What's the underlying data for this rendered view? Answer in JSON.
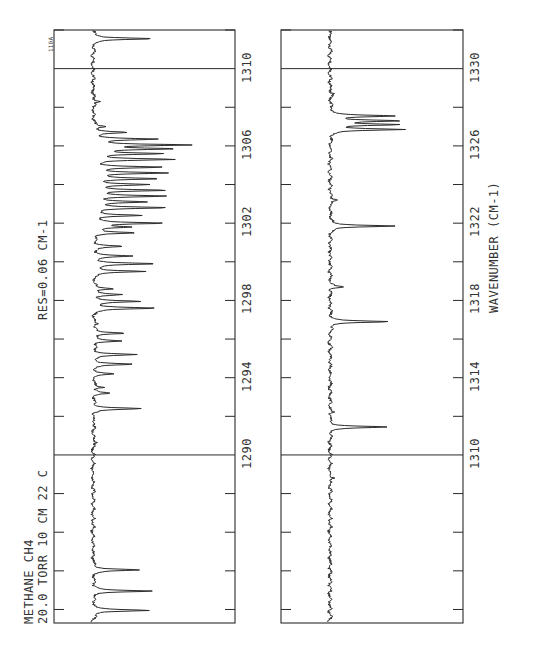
{
  "chart_data": {
    "type": "line",
    "title": "METHANE CH4",
    "subtitle_lines": [
      "METHANE  CH4",
      "20.0 TORR  10 CM  22 C"
    ],
    "annotation_resolution": "RES=0.06 CM-1",
    "plate_id": "110A",
    "xlabel": "WAVENUMBER (CM-1)",
    "ylabel": "",
    "orientation": "rotated -90deg (wavenumber increases upward, absorption extends right)",
    "grid": false,
    "panels": [
      {
        "name": "lower-range",
        "xlim": [
          1281.3,
          1312.0
        ],
        "ticks_labeled": [
          1290,
          1294,
          1298,
          1302,
          1306,
          1310
        ],
        "minor_ticks_every": 2,
        "boundary_lines": [
          1290,
          1310
        ],
        "series": [
          {
            "name": "transmittance",
            "peaks": [
              {
                "x": 1281.95,
                "depth": 0.78
              },
              {
                "x": 1282.95,
                "depth": 0.78
              },
              {
                "x": 1284.05,
                "depth": 0.62
              },
              {
                "x": 1290.65,
                "depth": 0.08
              },
              {
                "x": 1291.6,
                "depth": 0.05
              },
              {
                "x": 1292.4,
                "depth": 0.66
              },
              {
                "x": 1293.2,
                "depth": 0.22
              },
              {
                "x": 1293.5,
                "depth": 0.15
              },
              {
                "x": 1294.2,
                "depth": 0.27
              },
              {
                "x": 1294.7,
                "depth": 0.52
              },
              {
                "x": 1295.2,
                "depth": 0.57
              },
              {
                "x": 1295.9,
                "depth": 0.4
              },
              {
                "x": 1296.3,
                "depth": 0.45
              },
              {
                "x": 1296.8,
                "depth": 0.07
              },
              {
                "x": 1297.6,
                "depth": 0.86
              },
              {
                "x": 1297.95,
                "depth": 0.62
              },
              {
                "x": 1298.3,
                "depth": 0.36
              },
              {
                "x": 1298.6,
                "depth": 0.28
              },
              {
                "x": 1299.5,
                "depth": 0.7
              },
              {
                "x": 1299.9,
                "depth": 0.85
              },
              {
                "x": 1300.3,
                "depth": 0.5
              },
              {
                "x": 1300.8,
                "depth": 0.4
              },
              {
                "x": 1301.5,
                "depth": 0.55
              },
              {
                "x": 1301.8,
                "depth": 0.48
              },
              {
                "x": 1302.0,
                "depth": 0.92
              },
              {
                "x": 1302.4,
                "depth": 0.62
              },
              {
                "x": 1302.8,
                "depth": 1.0
              },
              {
                "x": 1303.1,
                "depth": 0.68
              },
              {
                "x": 1303.4,
                "depth": 0.92
              },
              {
                "x": 1303.7,
                "depth": 0.95
              },
              {
                "x": 1304.0,
                "depth": 0.7
              },
              {
                "x": 1304.3,
                "depth": 0.85
              },
              {
                "x": 1304.6,
                "depth": 0.98
              },
              {
                "x": 1304.9,
                "depth": 0.88
              },
              {
                "x": 1305.3,
                "depth": 1.05
              },
              {
                "x": 1305.6,
                "depth": 0.9
              },
              {
                "x": 1305.85,
                "depth": 1.02
              },
              {
                "x": 1306.05,
                "depth": 1.25
              },
              {
                "x": 1306.35,
                "depth": 0.82
              },
              {
                "x": 1306.7,
                "depth": 0.42
              },
              {
                "x": 1307.0,
                "depth": 0.18
              },
              {
                "x": 1308.3,
                "depth": 0.1
              },
              {
                "x": 1311.55,
                "depth": 0.82
              }
            ]
          }
        ]
      },
      {
        "name": "upper-range",
        "xlim": [
          1301.3,
          1332.0
        ],
        "ticks_labeled": [
          1310,
          1314,
          1318,
          1322,
          1326,
          1330
        ],
        "minor_ticks_every": 2,
        "boundary_lines": [
          1310,
          1330
        ],
        "series": [
          {
            "name": "transmittance",
            "peaks": [
              {
                "x": 1308.8,
                "depth": 0.07
              },
              {
                "x": 1311.45,
                "depth": 0.82
              },
              {
                "x": 1312.2,
                "depth": 0.05
              },
              {
                "x": 1316.9,
                "depth": 0.86
              },
              {
                "x": 1318.7,
                "depth": 0.2
              },
              {
                "x": 1323.2,
                "depth": 0.12
              },
              {
                "x": 1321.85,
                "depth": 0.96
              },
              {
                "x": 1326.85,
                "depth": 1.04
              },
              {
                "x": 1327.1,
                "depth": 0.93
              },
              {
                "x": 1327.3,
                "depth": 0.95
              },
              {
                "x": 1327.55,
                "depth": 0.92
              },
              {
                "x": 1328.7,
                "depth": 0.06
              }
            ]
          }
        ]
      }
    ]
  },
  "labels": {
    "header_line1": "METHANE  CH4",
    "header_line2": "20.0 TORR  10 CM  22 C",
    "resolution": "RES=0.06 CM-1",
    "plate_id": "110A",
    "xlabel": "WAVENUMBER (CM-1)"
  },
  "colors": {
    "ink": "#2a2a2a",
    "background": "#ffffff"
  }
}
